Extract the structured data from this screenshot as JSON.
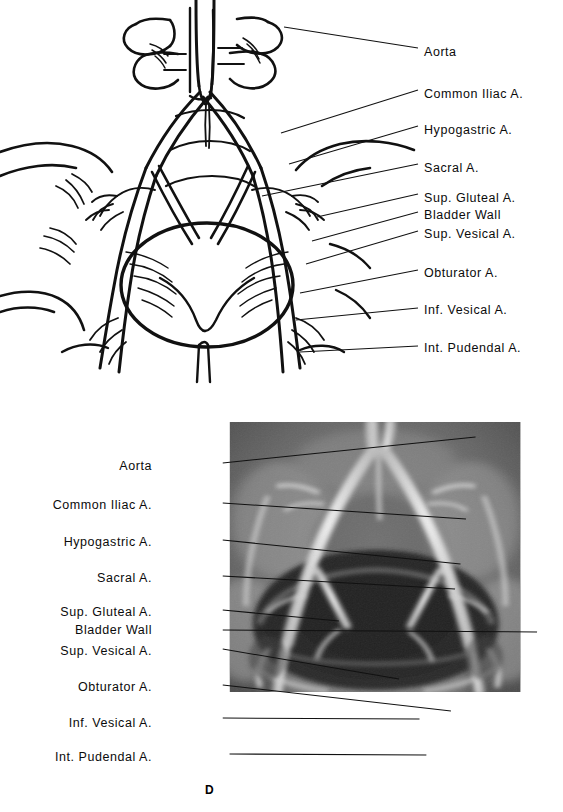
{
  "figure": {
    "panel_letter": "D",
    "panels": [
      {
        "id": "drawing",
        "type": "line-drawing",
        "label_column": "right",
        "labels": [
          {
            "text": "Aorta",
            "x": 424,
            "y": 52,
            "lx1": 284,
            "ly1": 27,
            "lx2": 418,
            "ly2": 48
          },
          {
            "text": "Common Iliac A.",
            "x": 424,
            "y": 94,
            "lx1": 281,
            "ly1": 133,
            "lx2": 418,
            "ly2": 90
          },
          {
            "text": "Hypogastric A.",
            "x": 424,
            "y": 130,
            "lx1": 289,
            "ly1": 164,
            "lx2": 418,
            "ly2": 126
          },
          {
            "text": "Sacral A.",
            "x": 424,
            "y": 168,
            "lx1": 262,
            "ly1": 196,
            "lx2": 418,
            "ly2": 164
          },
          {
            "text": "Sup. Gluteal A.",
            "x": 424,
            "y": 198,
            "lx1": 317,
            "ly1": 217,
            "lx2": 418,
            "ly2": 194
          },
          {
            "text": "Bladder Wall",
            "x": 424,
            "y": 215,
            "lx1": 312,
            "ly1": 241,
            "lx2": 418,
            "ly2": 212
          },
          {
            "text": "Sup. Vesical A.",
            "x": 424,
            "y": 234,
            "lx1": 306,
            "ly1": 264,
            "lx2": 418,
            "ly2": 231
          },
          {
            "text": "Obturator A.",
            "x": 424,
            "y": 273,
            "lx1": 300,
            "ly1": 293,
            "lx2": 418,
            "ly2": 270
          },
          {
            "text": "Inf. Vesical A.",
            "x": 424,
            "y": 310,
            "lx1": 296,
            "ly1": 320,
            "lx2": 418,
            "ly2": 308
          },
          {
            "text": "Int. Pudendal A.",
            "x": 424,
            "y": 348,
            "lx1": 300,
            "ly1": 352,
            "lx2": 418,
            "ly2": 346
          }
        ]
      },
      {
        "id": "radiograph",
        "type": "radiograph",
        "label_column": "left",
        "image_rect": {
          "x": 231,
          "y": 431,
          "w": 291,
          "h": 369
        },
        "labels": [
          {
            "text": "Aorta",
            "x": 152,
            "y": 466,
            "lx1": 163,
            "ly1": 463,
            "lx2": 348,
            "ly2": 437
          },
          {
            "text": "Common Iliac A.",
            "x": 152,
            "y": 505,
            "lx1": 163,
            "ly1": 503,
            "lx2": 341,
            "ly2": 519
          },
          {
            "text": "Hypogastric A.",
            "x": 152,
            "y": 542,
            "lx1": 163,
            "ly1": 540,
            "lx2": 337,
            "ly2": 564
          },
          {
            "text": "Sacral A.",
            "x": 152,
            "y": 578,
            "lx1": 163,
            "ly1": 576,
            "lx2": 333,
            "ly2": 589
          },
          {
            "text": "Sup. Gluteal A.",
            "x": 152,
            "y": 612,
            "lx1": 163,
            "ly1": 610,
            "lx2": 248,
            "ly2": 621
          },
          {
            "text": "Bladder Wall",
            "x": 152,
            "y": 630,
            "lx1": 163,
            "ly1": 630,
            "lx2": 393,
            "ly2": 632
          },
          {
            "text": "Sup. Vesical A.",
            "x": 152,
            "y": 651,
            "lx1": 163,
            "ly1": 649,
            "lx2": 292,
            "ly2": 679
          },
          {
            "text": "Obturator A.",
            "x": 152,
            "y": 687,
            "lx1": 163,
            "ly1": 685,
            "lx2": 330,
            "ly2": 711
          },
          {
            "text": "Inf. Vesical A.",
            "x": 152,
            "y": 723,
            "lx1": 163,
            "ly1": 718,
            "lx2": 307,
            "ly2": 719
          },
          {
            "text": "Int. Pudendal A.",
            "x": 152,
            "y": 757,
            "lx1": 168,
            "ly1": 754,
            "lx2": 312,
            "ly2": 755
          }
        ]
      }
    ]
  },
  "colors": {
    "ink": "#111111",
    "paper": "#ffffff",
    "film_light": "#b9b9b9",
    "film_mid": "#7c7c7c",
    "film_dark": "#3a3a3a",
    "bladder": "#2a2a2a",
    "vessel": "#e8e8e8"
  }
}
